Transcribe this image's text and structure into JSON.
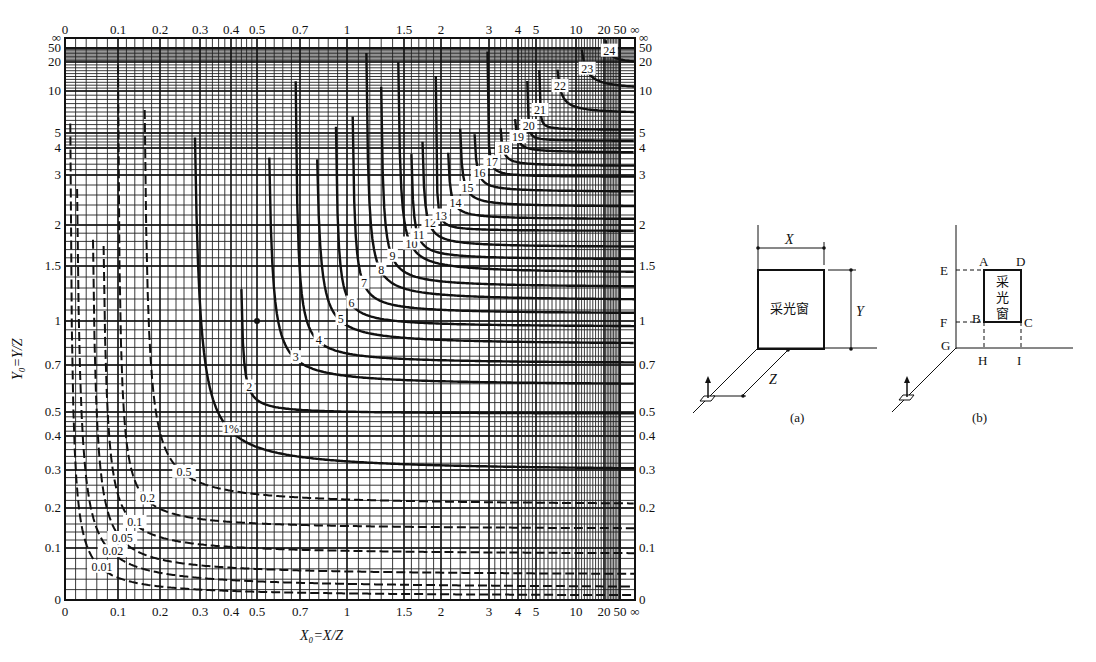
{
  "chart_data": {
    "type": "line",
    "title": "",
    "xlabel": "X₀=X/Z",
    "ylabel": "Y₀=Y/Z",
    "x_ticks": [
      "0",
      "0.1",
      "0.2",
      "0.3",
      "0.4",
      "0.5",
      "0.7",
      "1",
      "1.5",
      "2",
      "3",
      "4",
      "5",
      "10",
      "20",
      "50",
      "∞"
    ],
    "y_ticks": [
      "∞",
      "50",
      "20",
      "10",
      "5",
      "4",
      "3",
      "2",
      "1.5",
      "1",
      "0.7",
      "0.5",
      "0.4",
      "0.3",
      "0.2",
      "0.1",
      "0"
    ],
    "y_ticks_right": [
      "∞",
      "50",
      "20",
      "10",
      "5",
      "4",
      "3",
      "2",
      "1.5",
      "1",
      "0.7",
      "0.5",
      "0.4",
      "0.3",
      "0.2",
      "0.1",
      "0"
    ],
    "grid": true,
    "series_note": "Isolines of daylight factor (%) as function of X₀ and Y₀",
    "series": [
      {
        "name": "0.01",
        "style": "dashed",
        "x_asym": 0.01,
        "y_asym": 0.01,
        "label_at": [
          0.07,
          0.06
        ]
      },
      {
        "name": "0.02",
        "style": "dashed",
        "x_asym": 0.02,
        "y_asym": 0.025,
        "label_at": [
          0.09,
          0.09
        ]
      },
      {
        "name": "0.05",
        "style": "dashed",
        "x_asym": 0.05,
        "y_asym": 0.05,
        "label_at": [
          0.11,
          0.12
        ]
      },
      {
        "name": "0.1",
        "style": "dashed",
        "x_asym": 0.07,
        "y_asym": 0.09,
        "label_at": [
          0.14,
          0.16
        ]
      },
      {
        "name": "0.2",
        "style": "dashed",
        "x_asym": 0.1,
        "y_asym": 0.15,
        "label_at": [
          0.17,
          0.22
        ]
      },
      {
        "name": "0.5",
        "style": "dashed",
        "x_asym": 0.16,
        "y_asym": 0.21,
        "label_at": [
          0.26,
          0.29
        ]
      },
      {
        "name": "1%",
        "style": "solid",
        "x_asym": 0.28,
        "y_asym": 0.3,
        "label_at": [
          0.4,
          0.42
        ]
      },
      {
        "name": "2",
        "style": "solid",
        "x_asym": 0.44,
        "y_asym": 0.5,
        "label_at": [
          0.47,
          0.6
        ]
      },
      {
        "name": "3",
        "style": "solid",
        "x_asym": 0.55,
        "y_asym": 0.62,
        "label_at": [
          0.68,
          0.74
        ]
      },
      {
        "name": "4",
        "style": "solid",
        "x_asym": 0.68,
        "y_asym": 0.72,
        "label_at": [
          0.82,
          0.86
        ]
      },
      {
        "name": "5",
        "style": "solid",
        "x_asym": 0.8,
        "y_asym": 0.85,
        "label_at": [
          0.96,
          1.0
        ]
      },
      {
        "name": "6",
        "style": "solid",
        "x_asym": 0.93,
        "y_asym": 0.97,
        "label_at": [
          1.04,
          1.15
        ]
      },
      {
        "name": "7",
        "style": "solid",
        "x_asym": 1.05,
        "y_asym": 1.08,
        "label_at": [
          1.15,
          1.33
        ]
      },
      {
        "name": "8",
        "style": "solid",
        "x_asym": 1.17,
        "y_asym": 1.2,
        "label_at": [
          1.3,
          1.45
        ]
      },
      {
        "name": "9",
        "style": "solid",
        "x_asym": 1.3,
        "y_asym": 1.32,
        "label_at": [
          1.4,
          1.6
        ]
      },
      {
        "name": "10",
        "style": "solid",
        "x_asym": 1.45,
        "y_asym": 1.45,
        "label_at": [
          1.6,
          1.75
        ]
      },
      {
        "name": "11",
        "style": "solid",
        "x_asym": 1.6,
        "y_asym": 1.6,
        "label_at": [
          1.7,
          1.85
        ]
      },
      {
        "name": "12",
        "style": "solid",
        "x_asym": 1.75,
        "y_asym": 1.75,
        "label_at": [
          1.85,
          2.0
        ]
      },
      {
        "name": "13",
        "style": "solid",
        "x_asym": 1.95,
        "y_asym": 1.95,
        "label_at": [
          2.0,
          2.15
        ]
      },
      {
        "name": "14",
        "style": "solid",
        "x_asym": 2.15,
        "y_asym": 2.15,
        "label_at": [
          2.3,
          2.4
        ]
      },
      {
        "name": "15",
        "style": "solid",
        "x_asym": 2.4,
        "y_asym": 2.4,
        "label_at": [
          2.55,
          2.7
        ]
      },
      {
        "name": "16",
        "style": "solid",
        "x_asym": 2.7,
        "y_asym": 2.7,
        "label_at": [
          2.8,
          3.0
        ]
      },
      {
        "name": "17",
        "style": "solid",
        "x_asym": 3.0,
        "y_asym": 3.0,
        "label_at": [
          3.1,
          3.4
        ]
      },
      {
        "name": "18",
        "style": "solid",
        "x_asym": 3.4,
        "y_asym": 3.4,
        "label_at": [
          3.5,
          3.9
        ]
      },
      {
        "name": "19",
        "style": "solid",
        "x_asym": 3.9,
        "y_asym": 3.9,
        "label_at": [
          4.0,
          4.6
        ]
      },
      {
        "name": "20",
        "style": "solid",
        "x_asym": 4.6,
        "y_asym": 4.6,
        "label_at": [
          4.6,
          5.6
        ]
      },
      {
        "name": "21",
        "style": "solid",
        "x_asym": 5.6,
        "y_asym": 5.6,
        "label_at": [
          5.5,
          7.5
        ]
      },
      {
        "name": "22",
        "style": "solid",
        "x_asym": 7.5,
        "y_asym": 7.5,
        "label_at": [
          8,
          11
        ]
      },
      {
        "name": "23",
        "style": "solid",
        "x_asym": 11,
        "y_asym": 11,
        "label_at": [
          14,
          17
        ]
      },
      {
        "name": "24",
        "style": "solid",
        "x_asym": 20,
        "y_asym": 20,
        "label_at": [
          30,
          40
        ]
      }
    ],
    "marker_point": {
      "x": 0.5,
      "y": 1.0
    },
    "legend": "none"
  },
  "diagram_a": {
    "caption": "(a)",
    "window_label": "采光窗",
    "dim_x": "X",
    "dim_y": "Y",
    "dim_z": "Z"
  },
  "diagram_b": {
    "caption": "(b)",
    "window_label_chars": [
      "采",
      "光",
      "窗"
    ],
    "points": {
      "A": "A",
      "B": "B",
      "C": "C",
      "D": "D",
      "E": "E",
      "F": "F",
      "G": "G",
      "H": "H",
      "I": "I"
    }
  }
}
